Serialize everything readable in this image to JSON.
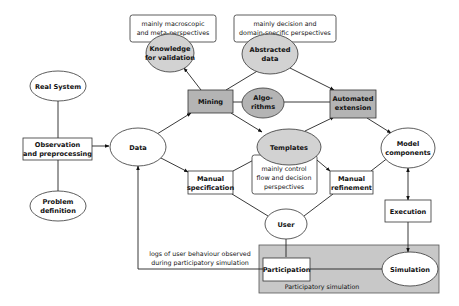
{
  "colors": {
    "node_white": "#ffffff",
    "node_gray": "#d2d2d2",
    "node_dark": "#b4b4b4",
    "region_gray": "#c8c8c8",
    "stroke": "#333333"
  },
  "nodes": {
    "real_system": {
      "lines": [
        "Real System"
      ],
      "shape": "ellipse",
      "fill": "white"
    },
    "observation": {
      "lines": [
        "Observation",
        "and preprocessing"
      ],
      "shape": "box",
      "fill": "white"
    },
    "problem_definition": {
      "lines": [
        "Problem",
        "definition"
      ],
      "shape": "ellipse",
      "fill": "white"
    },
    "data": {
      "lines": [
        "Data"
      ],
      "shape": "ellipse",
      "fill": "white"
    },
    "mining": {
      "lines": [
        "Mining"
      ],
      "shape": "box",
      "fill": "dark"
    },
    "knowledge": {
      "lines": [
        "Knowledge",
        "for validation"
      ],
      "shape": "ellipse",
      "fill": "gray"
    },
    "abstracted_data": {
      "lines": [
        "Abstracted",
        "data"
      ],
      "shape": "ellipse",
      "fill": "gray"
    },
    "algorithms": {
      "lines": [
        "Algo-",
        "rithms"
      ],
      "shape": "ellipse",
      "fill": "dark"
    },
    "automated_extension": {
      "lines": [
        "Automated",
        "extension"
      ],
      "shape": "box",
      "fill": "dark"
    },
    "templates": {
      "lines": [
        "Templates"
      ],
      "shape": "ellipse",
      "fill": "gray"
    },
    "manual_specification": {
      "lines": [
        "Manual",
        "specification"
      ],
      "shape": "box",
      "fill": "white"
    },
    "manual_refinement": {
      "lines": [
        "Manual",
        "refinement"
      ],
      "shape": "box",
      "fill": "white"
    },
    "model_components": {
      "lines": [
        "Model",
        "components"
      ],
      "shape": "ellipse",
      "fill": "white"
    },
    "user": {
      "lines": [
        "User"
      ],
      "shape": "ellipse",
      "fill": "white"
    },
    "execution": {
      "lines": [
        "Execution"
      ],
      "shape": "box",
      "fill": "white"
    },
    "participation": {
      "lines": [
        "Participation"
      ],
      "shape": "box",
      "fill": "white"
    },
    "simulation": {
      "lines": [
        "Simulation"
      ],
      "shape": "ellipse",
      "fill": "white"
    }
  },
  "notes": {
    "macroscopic": [
      "mainly macroscopic",
      "and meta-perspectives"
    ],
    "decision_domain": [
      "mainly decision and",
      "domain-specific perspectives"
    ],
    "control_flow": [
      "mainly control",
      "flow and decision",
      "perspectives"
    ],
    "logs": [
      "logs of user behaviour observed",
      "during participatory simulation"
    ]
  },
  "region": {
    "label": "Participatory simulation"
  },
  "edges": [
    {
      "from": "real_system",
      "to": "observation",
      "arrow": "none"
    },
    {
      "from": "problem_definition",
      "to": "observation",
      "arrow": "none"
    },
    {
      "from": "observation",
      "to": "data",
      "arrow": "end"
    },
    {
      "from": "data",
      "to": "mining",
      "arrow": "end"
    },
    {
      "from": "data",
      "to": "manual_specification",
      "arrow": "end"
    },
    {
      "from": "mining",
      "to": "knowledge",
      "arrow": "end"
    },
    {
      "from": "mining",
      "to": "abstracted_data",
      "arrow": "end"
    },
    {
      "from": "mining",
      "to": "algorithms",
      "arrow": "none"
    },
    {
      "from": "mining",
      "to": "templates",
      "arrow": "end"
    },
    {
      "from": "abstracted_data",
      "to": "automated_extension",
      "arrow": "end"
    },
    {
      "from": "algorithms",
      "to": "automated_extension",
      "arrow": "none"
    },
    {
      "from": "templates",
      "to": "automated_extension",
      "arrow": "end"
    },
    {
      "from": "automated_extension",
      "to": "model_components",
      "arrow": "end"
    },
    {
      "from": "manual_specification",
      "to": "templates",
      "arrow": "end"
    },
    {
      "from": "templates",
      "to": "manual_refinement",
      "arrow": "end"
    },
    {
      "from": "manual_refinement",
      "to": "model_components",
      "arrow": "end"
    },
    {
      "from": "user",
      "to": "manual_specification",
      "arrow": "none"
    },
    {
      "from": "user",
      "to": "manual_refinement",
      "arrow": "none"
    },
    {
      "from": "user",
      "to": "participation",
      "arrow": "none"
    },
    {
      "from": "model_components",
      "to": "execution",
      "arrow": "both"
    },
    {
      "from": "execution",
      "to": "simulation",
      "arrow": "end"
    },
    {
      "from": "participation",
      "to": "simulation",
      "arrow": "none"
    },
    {
      "from": "participation",
      "to": "data",
      "arrow": "end",
      "label": "logs"
    }
  ]
}
